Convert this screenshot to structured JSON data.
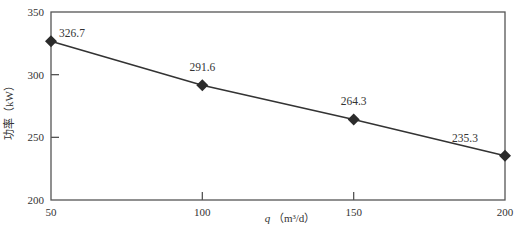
{
  "chart_data": {
    "type": "line",
    "title": "",
    "xlabel": "q（m³/d）",
    "xlabel_parts": {
      "var": "q",
      "unit": "（m³/d）"
    },
    "ylabel": "功率（kW）",
    "xlim": [
      50,
      200
    ],
    "ylim": [
      200,
      350
    ],
    "x_ticks": [
      50,
      100,
      150,
      200
    ],
    "y_ticks": [
      200,
      250,
      300,
      350
    ],
    "grid": false,
    "legend": null,
    "series": [
      {
        "name": "功率",
        "marker": "diamond",
        "color": "#2b2b2b",
        "x": [
          50,
          100,
          150,
          200
        ],
        "values": [
          326.7,
          291.6,
          264.3,
          235.3
        ],
        "labels": [
          "326.7",
          "291.6",
          "264.3",
          "235.3"
        ]
      }
    ]
  }
}
